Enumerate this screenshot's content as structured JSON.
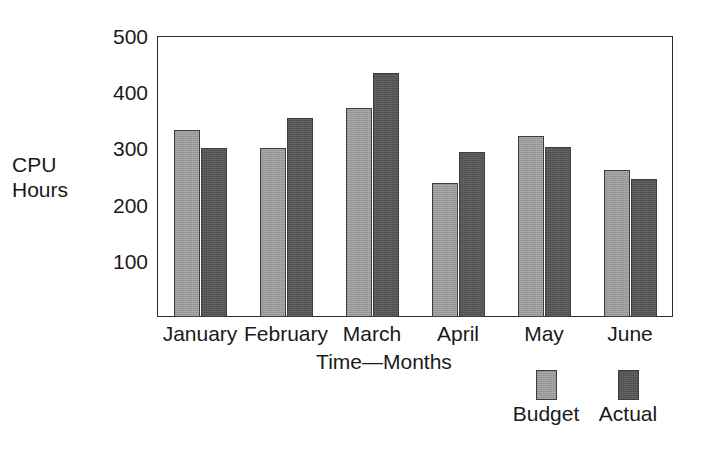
{
  "chart_data": {
    "type": "bar",
    "title": "",
    "subtitle": "",
    "xlabel": "Time—Months",
    "ylabel": "CPU Hours",
    "categories": [
      "January",
      "February",
      "March",
      "April",
      "May",
      "June"
    ],
    "series": [
      {
        "name": "Budget",
        "color": "#9b9b9b",
        "values": [
          332,
          301,
          372,
          238,
          322,
          262
        ]
      },
      {
        "name": "Actual",
        "color": "#575757",
        "values": [
          301,
          355,
          435,
          293,
          302,
          245
        ]
      }
    ],
    "yticks": [
      100,
      200,
      300,
      400,
      500
    ],
    "ylim": [
      0,
      500
    ],
    "grid": false,
    "legend_position": "bottom-right",
    "frame": true
  },
  "axes": {
    "y_title_line1": "CPU",
    "y_title_line2": "Hours",
    "x_title": "Time—Months"
  },
  "legend": {
    "items": [
      {
        "label": "Budget",
        "color": "#9b9b9b"
      },
      {
        "label": "Actual",
        "color": "#575757"
      }
    ]
  },
  "colors": {
    "budget": "#9b9b9b",
    "actual": "#575757",
    "frame": "#2a2a2a",
    "text": "#1a1a1a",
    "background": "#ffffff"
  }
}
